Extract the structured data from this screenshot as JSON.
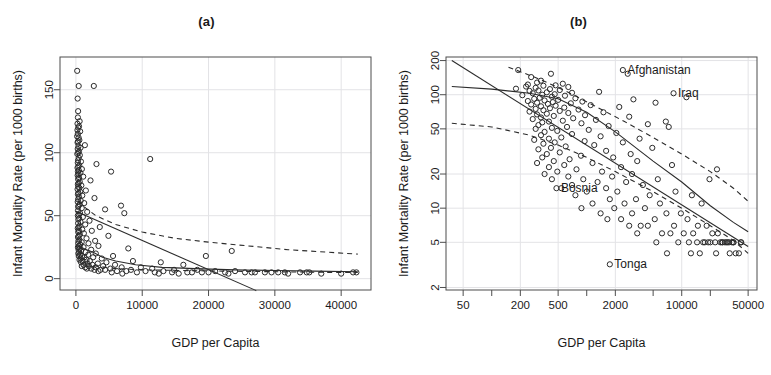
{
  "figure": {
    "panels": [
      {
        "id": "a",
        "title": "(a)",
        "xlabel": "GDP per Capita",
        "ylabel": "Infant Mortality Rate (per 1000 births)",
        "xscale": "linear",
        "yscale": "linear",
        "xticks": [
          0,
          10000,
          20000,
          30000,
          40000
        ],
        "xtick_labels": [
          "0",
          "10000",
          "20000",
          "30000",
          "40000"
        ],
        "yticks": [
          0,
          50,
          100,
          150
        ],
        "ytick_labels": [
          "0",
          "50",
          "100",
          "150"
        ],
        "xlim": [
          -2400,
          44500
        ],
        "ylim": [
          -9,
          176
        ],
        "annotations": []
      },
      {
        "id": "b",
        "title": "(b)",
        "xlabel": "GDP per Capita",
        "ylabel": "Infant Mortality Rate (per 1000 births)",
        "xscale": "log",
        "yscale": "log",
        "xticks": [
          50,
          200,
          500,
          2000,
          10000,
          50000
        ],
        "xtick_labels": [
          "50",
          "200",
          "500",
          "2000",
          "10000",
          "50000"
        ],
        "xminorticks": [
          100,
          1000,
          5000,
          20000
        ],
        "yticks": [
          2,
          5,
          10,
          20,
          50,
          100,
          200
        ],
        "ytick_labels": [
          "2",
          "5",
          "10",
          "20",
          "50",
          "100",
          "200"
        ],
        "xlim": [
          33,
          62000
        ],
        "ylim": [
          1.9,
          215
        ],
        "annotations": [
          {
            "label": "Afghanistan",
            "x": 2400,
            "y": 165
          },
          {
            "label": "Iraq",
            "x": 8200,
            "y": 103
          },
          {
            "label": "Bosnia",
            "x": 480,
            "y": 15
          },
          {
            "label": "Tonga",
            "x": 1750,
            "y": 3.2
          }
        ]
      }
    ]
  },
  "chart_data": {
    "type": "scatter",
    "xlabel": "GDP per Capita",
    "ylabel": "Infant Mortality Rate (per 1000 births)",
    "marker": "open-circle",
    "grid": true,
    "legend": "none",
    "points": [
      [
        190,
        165
      ],
      [
        420,
        153
      ],
      [
        2700,
        153
      ],
      [
        260,
        143
      ],
      [
        330,
        133
      ],
      [
        300,
        128
      ],
      [
        560,
        125
      ],
      [
        240,
        123
      ],
      [
        470,
        121
      ],
      [
        350,
        120
      ],
      [
        230,
        118
      ],
      [
        640,
        117
      ],
      [
        290,
        115
      ],
      [
        180,
        113
      ],
      [
        410,
        112
      ],
      [
        520,
        110
      ],
      [
        310,
        109
      ],
      [
        250,
        108
      ],
      [
        1350,
        106
      ],
      [
        380,
        105
      ],
      [
        700,
        104
      ],
      [
        270,
        103
      ],
      [
        460,
        101
      ],
      [
        340,
        100
      ],
      [
        210,
        99
      ],
      [
        590,
        98
      ],
      [
        430,
        96
      ],
      [
        11200,
        95
      ],
      [
        320,
        94
      ],
      [
        760,
        93
      ],
      [
        280,
        92
      ],
      [
        3100,
        91
      ],
      [
        500,
        90
      ],
      [
        360,
        89
      ],
      [
        240,
        88
      ],
      [
        900,
        87
      ],
      [
        440,
        86
      ],
      [
        300,
        85
      ],
      [
        5300,
        85
      ],
      [
        680,
        84
      ],
      [
        390,
        83
      ],
      [
        260,
        82
      ],
      [
        1100,
        81
      ],
      [
        470,
        80
      ],
      [
        330,
        79
      ],
      [
        2200,
        78
      ],
      [
        580,
        77
      ],
      [
        410,
        76
      ],
      [
        290,
        75
      ],
      [
        820,
        74
      ],
      [
        350,
        73
      ],
      [
        520,
        72
      ],
      [
        250,
        71
      ],
      [
        1500,
        70
      ],
      [
        640,
        69
      ],
      [
        380,
        68
      ],
      [
        300,
        67
      ],
      [
        960,
        66
      ],
      [
        450,
        65
      ],
      [
        2800,
        64
      ],
      [
        330,
        63
      ],
      [
        720,
        62
      ],
      [
        270,
        61
      ],
      [
        1250,
        60
      ],
      [
        560,
        59
      ],
      [
        400,
        58
      ],
      [
        6800,
        58
      ],
      [
        340,
        57
      ],
      [
        880,
        56
      ],
      [
        4400,
        55
      ],
      [
        310,
        54
      ],
      [
        1700,
        53
      ],
      [
        620,
        52
      ],
      [
        7300,
        52
      ],
      [
        430,
        51
      ],
      [
        290,
        50
      ],
      [
        1050,
        49
      ],
      [
        490,
        48
      ],
      [
        360,
        47
      ],
      [
        2050,
        46
      ],
      [
        700,
        45
      ],
      [
        330,
        44
      ],
      [
        1400,
        43
      ],
      [
        540,
        42
      ],
      [
        400,
        41
      ],
      [
        3600,
        41
      ],
      [
        280,
        40
      ],
      [
        950,
        39
      ],
      [
        460,
        38
      ],
      [
        2400,
        38
      ],
      [
        350,
        37
      ],
      [
        1200,
        36
      ],
      [
        600,
        35
      ],
      [
        420,
        34
      ],
      [
        4900,
        34
      ],
      [
        310,
        33
      ],
      [
        1600,
        32
      ],
      [
        520,
        31
      ],
      [
        380,
        30
      ],
      [
        2900,
        30
      ],
      [
        870,
        29
      ],
      [
        340,
        28
      ],
      [
        1900,
        28
      ],
      [
        660,
        27
      ],
      [
        450,
        26
      ],
      [
        3400,
        26
      ],
      [
        300,
        25
      ],
      [
        1150,
        25
      ],
      [
        580,
        24
      ],
      [
        7900,
        24
      ],
      [
        400,
        23
      ],
      [
        2300,
        23
      ],
      [
        780,
        22
      ],
      [
        490,
        21
      ],
      [
        23500,
        22
      ],
      [
        1450,
        21
      ],
      [
        360,
        20
      ],
      [
        3000,
        20
      ],
      [
        640,
        19
      ],
      [
        1850,
        19
      ],
      [
        920,
        18
      ],
      [
        430,
        18
      ],
      [
        5600,
        18
      ],
      [
        2600,
        17
      ],
      [
        1300,
        17
      ],
      [
        700,
        16
      ],
      [
        19600,
        18
      ],
      [
        3900,
        16
      ],
      [
        540,
        15
      ],
      [
        1600,
        15
      ],
      [
        2100,
        14
      ],
      [
        1000,
        14
      ],
      [
        8600,
        14
      ],
      [
        4600,
        13
      ],
      [
        760,
        13
      ],
      [
        1750,
        12
      ],
      [
        12800,
        13
      ],
      [
        3300,
        12
      ],
      [
        1150,
        11
      ],
      [
        5900,
        11
      ],
      [
        2500,
        11
      ],
      [
        880,
        10
      ],
      [
        16200,
        11
      ],
      [
        4100,
        10
      ],
      [
        1950,
        10
      ],
      [
        6900,
        9
      ],
      [
        1400,
        9
      ],
      [
        9800,
        9
      ],
      [
        3000,
        9
      ],
      [
        2300,
        8
      ],
      [
        1650,
        8
      ],
      [
        5200,
        8
      ],
      [
        11500,
        8
      ],
      [
        3700,
        7
      ],
      [
        2800,
        7
      ],
      [
        14800,
        7
      ],
      [
        8300,
        7
      ],
      [
        4400,
        7
      ],
      [
        18300,
        7
      ],
      [
        6200,
        6
      ],
      [
        10500,
        6
      ],
      [
        3400,
        6
      ],
      [
        21000,
        6
      ],
      [
        13200,
        6
      ],
      [
        7600,
        6
      ],
      [
        24000,
        6
      ],
      [
        16800,
        5
      ],
      [
        9200,
        5
      ],
      [
        27000,
        5
      ],
      [
        11900,
        5
      ],
      [
        20000,
        5
      ],
      [
        5400,
        5
      ],
      [
        29500,
        5
      ],
      [
        14500,
        5
      ],
      [
        22500,
        5
      ],
      [
        31500,
        5
      ],
      [
        17500,
        5
      ],
      [
        25500,
        5
      ],
      [
        33800,
        5
      ],
      [
        28500,
        5
      ],
      [
        35200,
        5
      ],
      [
        19000,
        5
      ],
      [
        30500,
        5
      ],
      [
        41800,
        5
      ],
      [
        42300,
        5
      ],
      [
        26500,
        5
      ],
      [
        23000,
        4
      ],
      [
        12500,
        4
      ],
      [
        34800,
        5
      ],
      [
        37000,
        4
      ],
      [
        15500,
        4
      ],
      [
        40000,
        4
      ],
      [
        7000,
        4
      ],
      [
        32000,
        4
      ]
    ],
    "fits": {
      "panel_a": [
        {
          "name": "linear-regression",
          "style": "solid",
          "points": [
            [
              0,
              53.5
            ],
            [
              27200,
              -9.5
            ]
          ]
        },
        {
          "name": "upper-dashed-curve",
          "style": "dashed",
          "points": [
            [
              300,
              62
            ],
            [
              1500,
              56
            ],
            [
              3000,
              50
            ],
            [
              6000,
              43
            ],
            [
              10000,
              37
            ],
            [
              15000,
              32
            ],
            [
              20000,
              29
            ],
            [
              26000,
              26
            ],
            [
              32000,
              23
            ],
            [
              38000,
              21
            ],
            [
              42500,
              19.5
            ]
          ]
        },
        {
          "name": "loess-smoother",
          "style": "solid",
          "points": [
            [
              200,
              26
            ],
            [
              800,
              25
            ],
            [
              1600,
              23
            ],
            [
              2600,
              21
            ],
            [
              4000,
              17
            ],
            [
              6000,
              14
            ],
            [
              9000,
              11
            ],
            [
              13000,
              9
            ],
            [
              18000,
              8
            ],
            [
              24000,
              7
            ],
            [
              30000,
              6.5
            ],
            [
              36000,
              6
            ],
            [
              42500,
              5.5
            ]
          ]
        },
        {
          "name": "lower-dashed-curve",
          "style": "dashed",
          "points": [
            [
              300,
              17
            ],
            [
              1500,
              12
            ],
            [
              3000,
              10
            ],
            [
              6000,
              8
            ],
            [
              10000,
              7
            ],
            [
              16000,
              6.5
            ],
            [
              22000,
              6
            ],
            [
              30000,
              5.5
            ],
            [
              38000,
              5
            ],
            [
              42500,
              5
            ]
          ]
        }
      ],
      "panel_b": [
        {
          "name": "linear-regression",
          "style": "solid",
          "points": [
            [
              38,
              200
            ],
            [
              50000,
              4.6
            ]
          ]
        },
        {
          "name": "loess-smoother",
          "style": "solid",
          "points": [
            [
              38,
              118
            ],
            [
              100,
              112
            ],
            [
              250,
              103
            ],
            [
              500,
              92
            ],
            [
              1000,
              70
            ],
            [
              2000,
              47
            ],
            [
              5000,
              26
            ],
            [
              10000,
              17
            ],
            [
              20000,
              10.5
            ],
            [
              35000,
              7.5
            ],
            [
              50000,
              6.2
            ]
          ]
        },
        {
          "name": "upper-dashed-curve",
          "style": "dashed",
          "points": [
            [
              150,
              175
            ],
            [
              300,
              140
            ],
            [
              600,
              108
            ],
            [
              1200,
              80
            ],
            [
              2500,
              58
            ],
            [
              5000,
              42
            ],
            [
              10000,
              30
            ],
            [
              20000,
              21
            ],
            [
              35000,
              15
            ],
            [
              50000,
              11.5
            ]
          ]
        },
        {
          "name": "lower-dashed-curve",
          "style": "dashed",
          "points": [
            [
              38,
              56
            ],
            [
              100,
              52
            ],
            [
              250,
              44
            ],
            [
              500,
              36
            ],
            [
              1000,
              28
            ],
            [
              2000,
              21
            ],
            [
              5000,
              14
            ],
            [
              10000,
              10
            ],
            [
              20000,
              7
            ],
            [
              35000,
              5.2
            ],
            [
              50000,
              4.0
            ]
          ]
        }
      ]
    }
  }
}
